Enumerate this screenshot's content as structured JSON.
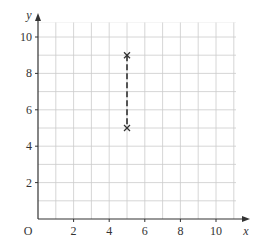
{
  "chart_data": {
    "type": "scatter",
    "title": "",
    "xlabel": "x",
    "ylabel": "y",
    "origin_label": "O",
    "xlim": [
      0,
      10
    ],
    "ylim": [
      0,
      10
    ],
    "grid": true,
    "grid_step": 1,
    "x_ticks": [
      2,
      4,
      6,
      8,
      10
    ],
    "y_ticks": [
      2,
      4,
      6,
      8,
      10
    ],
    "points": [
      {
        "x": 5,
        "y": 9,
        "marker": "x"
      },
      {
        "x": 5,
        "y": 5,
        "marker": "x"
      }
    ],
    "segments": [
      {
        "from": [
          5,
          9
        ],
        "to": [
          5,
          5
        ],
        "style": "dashed"
      }
    ],
    "colors": {
      "grid": "#cccccc",
      "axis": "#333333",
      "line": "#555555"
    }
  }
}
